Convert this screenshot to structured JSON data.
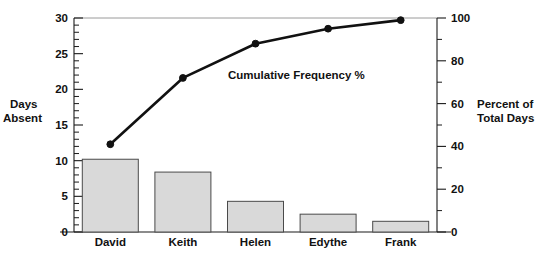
{
  "chart_data": {
    "type": "bar",
    "title": "",
    "categories": [
      "David",
      "Keith",
      "Helen",
      "Edythe",
      "Frank"
    ],
    "values": [
      10.2,
      8.4,
      4.3,
      2.5,
      1.5
    ],
    "series": [
      {
        "name": "Days Absent",
        "type": "bar",
        "axis": "left",
        "values": [
          10.2,
          8.4,
          4.3,
          2.5,
          1.5
        ]
      },
      {
        "name": "Cumulative Frequency %",
        "type": "line",
        "axis": "right",
        "values": [
          41,
          72,
          88,
          95,
          99
        ]
      }
    ],
    "xlabel": "",
    "ylabel": "Days Absent",
    "y2label": "Percent of Total Days",
    "ylim": [
      0,
      30
    ],
    "y2lim": [
      0,
      100
    ],
    "yticks": [
      0,
      5,
      10,
      15,
      20,
      25,
      30
    ],
    "y2ticks": [
      0,
      20,
      40,
      60,
      80,
      100
    ],
    "y_minor_step": 1,
    "y2_minor_step": 10,
    "grid": false,
    "legend": "none",
    "annotations": [
      {
        "text": "Cumulative Frequency %",
        "x": 3.0,
        "y": 21.3
      }
    ]
  },
  "axes": {
    "left": {
      "title_line1": "Days",
      "title_line2": "Absent",
      "tick_labels": [
        "30",
        "25",
        "20",
        "15",
        "10",
        "5",
        "0"
      ]
    },
    "right": {
      "title_line1": "Percent of",
      "title_line2": "Total Days",
      "tick_labels": [
        "100",
        "80",
        "60",
        "40",
        "20",
        "0"
      ]
    }
  },
  "annotation": {
    "cumulative_label": "Cumulative Frequency %"
  },
  "colors": {
    "bar_fill": "#d9d9d9",
    "bar_stroke": "#4a4a4a",
    "line": "#111111",
    "axis": "#1a1a1a",
    "top_rule": "#9a9a9a",
    "background": "#ffffff"
  }
}
